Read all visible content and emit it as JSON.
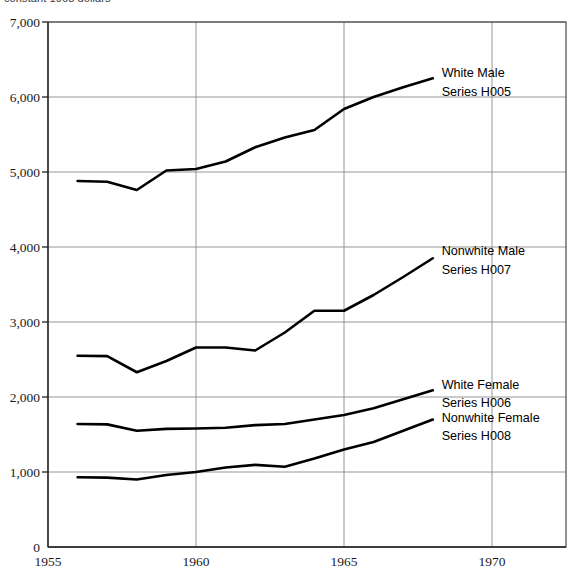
{
  "caption": "constant 1968 dollars",
  "chart_data": {
    "type": "line",
    "title": "",
    "subtitle": "",
    "xlabel": "",
    "ylabel": "",
    "xlim": [
      1955,
      1972.5
    ],
    "ylim": [
      0,
      7000
    ],
    "grid": true,
    "legend_position": "inline-right",
    "x_ticks": [
      "1955",
      "1960",
      "1965",
      "1970"
    ],
    "x_tick_values": [
      1955,
      1960,
      1965,
      1970
    ],
    "y_ticks": [
      "0",
      "1,000",
      "2,000",
      "3,000",
      "4,000",
      "5,000",
      "6,000",
      "7,000"
    ],
    "y_tick_values": [
      0,
      1000,
      2000,
      3000,
      4000,
      5000,
      6000,
      7000
    ],
    "x": [
      1956,
      1957,
      1958,
      1959,
      1960,
      1961,
      1962,
      1963,
      1964,
      1965,
      1966,
      1967,
      1968
    ],
    "series": [
      {
        "name": "White Male",
        "code": "Series H005",
        "label_line1": "White Male",
        "label_line2": "Series H005",
        "color": "#000000",
        "values": [
          4880,
          4870,
          4760,
          5020,
          5040,
          5140,
          5330,
          5460,
          5560,
          5840,
          6000,
          6130,
          6250
        ]
      },
      {
        "name": "Nonwhite Male",
        "code": "Series H007",
        "label_line1": "Nonwhite Male",
        "label_line2": "Series H007",
        "color": "#000000",
        "values": [
          2550,
          2545,
          2330,
          2480,
          2660,
          2660,
          2620,
          2860,
          3150,
          3150,
          3360,
          3600,
          3850
        ]
      },
      {
        "name": "White Female",
        "code": "Series H006",
        "label_line1": "White Female",
        "label_line2": "Series H006",
        "color": "#000000",
        "values": [
          1640,
          1635,
          1550,
          1575,
          1580,
          1590,
          1625,
          1640,
          1700,
          1760,
          1850,
          1970,
          2090
        ]
      },
      {
        "name": "Nonwhite Female",
        "code": "Series H008",
        "label_line1": "Nonwhite Female",
        "label_line2": "Series H008",
        "color": "#000000",
        "values": [
          930,
          925,
          900,
          960,
          1000,
          1060,
          1095,
          1070,
          1180,
          1300,
          1400,
          1550,
          1700
        ]
      }
    ],
    "annotations": [
      {
        "text": "White Male",
        "x": 1968.3,
        "y": 6330
      },
      {
        "text": "Series H005",
        "x": 1968.3,
        "y": 6080
      },
      {
        "text": "Nonwhite Male",
        "x": 1968.3,
        "y": 3960
      },
      {
        "text": "Series H007",
        "x": 1968.3,
        "y": 3710
      },
      {
        "text": "White Female",
        "x": 1968.3,
        "y": 2180
      },
      {
        "text": "Series H006",
        "x": 1968.3,
        "y": 1935
      },
      {
        "text": "Nonwhite Female",
        "x": 1968.3,
        "y": 1740
      },
      {
        "text": "Series H008",
        "x": 1968.3,
        "y": 1495
      }
    ]
  }
}
